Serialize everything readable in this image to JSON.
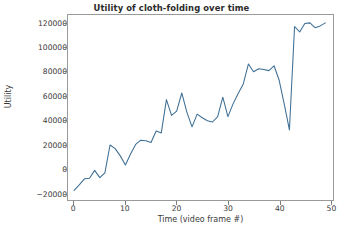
{
  "chart_data": {
    "type": "line",
    "title": "Utility of cloth-folding over time",
    "xlabel": "Time (video frame #)",
    "ylabel": "Utility",
    "xlim": [
      -1.2,
      50.5
    ],
    "ylim": [
      -26000,
      127000
    ],
    "grid": false,
    "legend": null,
    "line_color": "#3d6e94",
    "x": [
      0,
      1,
      2,
      3,
      4,
      5,
      6,
      7,
      8,
      9,
      10,
      11,
      12,
      13,
      14,
      15,
      16,
      17,
      18,
      19,
      20,
      21,
      22,
      23,
      24,
      25,
      26,
      27,
      28,
      29,
      30,
      31,
      32,
      33,
      34,
      35,
      36,
      37,
      38,
      39,
      40,
      41,
      42,
      43,
      44,
      45,
      46,
      47,
      48,
      49
    ],
    "values": [
      -18000,
      -13500,
      -8500,
      -8000,
      -1500,
      -7500,
      -3500,
      19500,
      16500,
      10500,
      3000,
      12000,
      20000,
      23500,
      23000,
      21500,
      31000,
      29500,
      57000,
      44000,
      47500,
      62500,
      46500,
      34500,
      45000,
      42000,
      39500,
      38500,
      43000,
      59000,
      43000,
      53500,
      62000,
      70000,
      86500,
      80000,
      82500,
      82000,
      81000,
      85000,
      73000,
      53000,
      32000,
      117500,
      113000,
      120000,
      120500,
      116500,
      118000,
      120500
    ],
    "xticks": [
      0,
      10,
      20,
      30,
      40,
      50
    ],
    "xtick_labels": [
      "0",
      "10",
      "20",
      "30",
      "40",
      "50"
    ],
    "yticks": [
      -20000,
      0,
      20000,
      40000,
      60000,
      80000,
      100000,
      120000
    ],
    "ytick_labels": [
      "−20000",
      "0",
      "20000",
      "40000",
      "60000",
      "80000",
      "100000",
      "120000"
    ]
  }
}
